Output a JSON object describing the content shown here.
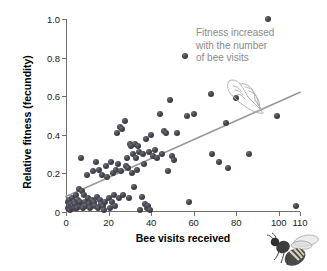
{
  "chart_data": {
    "type": "scatter",
    "title": "",
    "xlabel": "Bee visits received",
    "ylabel": "Relative fitness (fecundity)",
    "xlim": [
      0,
      110
    ],
    "ylim": [
      0,
      1.0
    ],
    "xticks": [
      0,
      20,
      40,
      60,
      80,
      100,
      110
    ],
    "xticklabels": [
      "0",
      "20",
      "40",
      "60",
      "80",
      "100",
      "110"
    ],
    "yticks": [
      0,
      0.2,
      0.4,
      0.6,
      0.8,
      1.0
    ],
    "yticklabels": [
      "0",
      "0.2",
      "0.4",
      "0.6",
      "0.8",
      "1.0"
    ],
    "grid": false,
    "legend": null,
    "marker_color": "#3a3a44",
    "trendline": {
      "color": "#9a9a9a",
      "x": [
        0,
        110
      ],
      "y": [
        0.08,
        0.62
      ]
    },
    "annotations": [
      {
        "text": "Fitness increased with the number of bee visits",
        "lines": [
          "Fitness increased",
          "with the number",
          "of bee visits"
        ],
        "color": "#8a8a8a"
      }
    ],
    "points": [
      [
        0.8,
        0.02
      ],
      [
        1.0,
        0.05
      ],
      [
        1.3,
        0.03
      ],
      [
        1.6,
        0.06
      ],
      [
        2.0,
        0.01
      ],
      [
        2.3,
        0.04
      ],
      [
        2.7,
        0.02
      ],
      [
        3.0,
        0.07
      ],
      [
        3.3,
        0.03
      ],
      [
        3.6,
        0.05
      ],
      [
        4.0,
        0.02
      ],
      [
        4.4,
        0.04
      ],
      [
        4.8,
        0.09
      ],
      [
        5.2,
        0.02
      ],
      [
        5.6,
        0.06
      ],
      [
        6.0,
        0.12
      ],
      [
        6.4,
        0.03
      ],
      [
        6.8,
        0.05
      ],
      [
        7.2,
        0.28
      ],
      [
        7.6,
        0.11
      ],
      [
        8.0,
        0.02
      ],
      [
        8.5,
        0.09
      ],
      [
        9.0,
        0.05
      ],
      [
        9.5,
        0.03
      ],
      [
        10.0,
        0.19
      ],
      [
        10.5,
        0.07
      ],
      [
        11.0,
        0.04
      ],
      [
        11.5,
        0.02
      ],
      [
        12.0,
        0.06
      ],
      [
        12.5,
        0.21
      ],
      [
        13.0,
        0.05
      ],
      [
        13.5,
        0.03
      ],
      [
        14.0,
        0.26
      ],
      [
        14.5,
        0.08
      ],
      [
        15.0,
        0.02
      ],
      [
        15.5,
        0.22
      ],
      [
        16.0,
        0.06
      ],
      [
        16.5,
        0.04
      ],
      [
        17.0,
        0.19
      ],
      [
        17.5,
        0.03
      ],
      [
        18.0,
        0.01
      ],
      [
        18.5,
        0.05
      ],
      [
        19.0,
        0.24
      ],
      [
        19.5,
        0.18
      ],
      [
        20.0,
        0.07
      ],
      [
        20.5,
        0.02
      ],
      [
        21.0,
        0.26
      ],
      [
        21.5,
        0.05
      ],
      [
        22.0,
        0.2
      ],
      [
        22.5,
        0.09
      ],
      [
        23.0,
        0.03
      ],
      [
        23.5,
        0.22
      ],
      [
        24.0,
        0.41
      ],
      [
        24.5,
        0.25
      ],
      [
        25.0,
        0.07
      ],
      [
        25.5,
        0.44
      ],
      [
        26.0,
        0.21
      ],
      [
        26.5,
        0.43
      ],
      [
        27.0,
        0.09
      ],
      [
        27.5,
        0.47
      ],
      [
        28.0,
        0.24
      ],
      [
        28.5,
        0.28
      ],
      [
        29.0,
        0.23
      ],
      [
        29.5,
        0.07
      ],
      [
        30.0,
        0.35
      ],
      [
        30.5,
        0.34
      ],
      [
        31.0,
        0.2
      ],
      [
        31.5,
        0.3
      ],
      [
        32.0,
        0.13
      ],
      [
        32.5,
        0.35
      ],
      [
        33.0,
        0.28
      ],
      [
        33.5,
        0.22
      ],
      [
        34.0,
        0.34
      ],
      [
        34.5,
        0.31
      ],
      [
        35.0,
        0.01
      ],
      [
        35.5,
        0.08
      ],
      [
        36.0,
        0.3
      ],
      [
        36.5,
        0.25
      ],
      [
        37.0,
        0.04
      ],
      [
        37.5,
        0.38
      ],
      [
        38.0,
        0.02
      ],
      [
        38.5,
        0.03
      ],
      [
        39.0,
        0.31
      ],
      [
        39.5,
        0.01
      ],
      [
        40.0,
        0.4
      ],
      [
        41.0,
        0.29
      ],
      [
        42.0,
        0.32
      ],
      [
        43.0,
        0.28
      ],
      [
        44.0,
        0.51
      ],
      [
        45.0,
        0.3
      ],
      [
        46.0,
        0.42
      ],
      [
        47.0,
        0.41
      ],
      [
        48.0,
        0.21
      ],
      [
        49.0,
        0.58
      ],
      [
        50.0,
        0.29
      ],
      [
        51.0,
        0.27
      ],
      [
        52.0,
        0.41
      ],
      [
        56.0,
        0.81
      ],
      [
        57.0,
        0.5
      ],
      [
        58.0,
        0.05
      ],
      [
        60.0,
        0.51
      ],
      [
        68.0,
        0.61
      ],
      [
        68.5,
        0.3
      ],
      [
        72.0,
        0.26
      ],
      [
        75.0,
        0.46
      ],
      [
        76.0,
        0.23
      ],
      [
        80.0,
        0.59
      ],
      [
        86.0,
        0.3
      ],
      [
        95.0,
        1.0
      ],
      [
        99.0,
        0.5
      ],
      [
        108.0,
        0.03
      ]
    ]
  },
  "icons": {
    "hand": "pointing-hand-icon",
    "bee": "honeybee-illustration"
  }
}
